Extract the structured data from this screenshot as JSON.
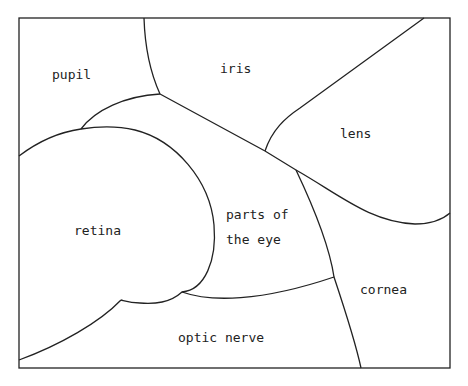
{
  "diagram": {
    "type": "concept-map",
    "center_label": {
      "line1": "parts of",
      "line2": "the eye"
    },
    "regions": [
      {
        "id": "pupil",
        "label": "pupil"
      },
      {
        "id": "iris",
        "label": "iris"
      },
      {
        "id": "lens",
        "label": "lens"
      },
      {
        "id": "retina",
        "label": "retina"
      },
      {
        "id": "cornea",
        "label": "cornea"
      },
      {
        "id": "optic-nerve",
        "label": "optic nerve"
      }
    ],
    "colors": {
      "stroke": "#222222",
      "background": "#ffffff",
      "text": "#222222"
    }
  }
}
